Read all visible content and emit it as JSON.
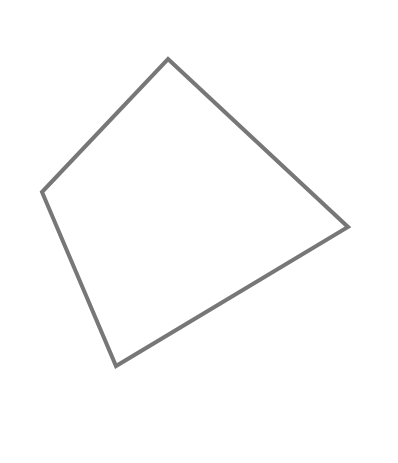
{
  "diagram": {
    "type": "quadrilateral",
    "background": "#ffffff",
    "stroke_color": "#777777",
    "stroke_width": 4,
    "fill": "none",
    "vertices": [
      {
        "name": "top",
        "x": 168,
        "y": 59
      },
      {
        "name": "right",
        "x": 348,
        "y": 227
      },
      {
        "name": "bottom",
        "x": 116,
        "y": 366
      },
      {
        "name": "left",
        "x": 42,
        "y": 192
      }
    ]
  }
}
